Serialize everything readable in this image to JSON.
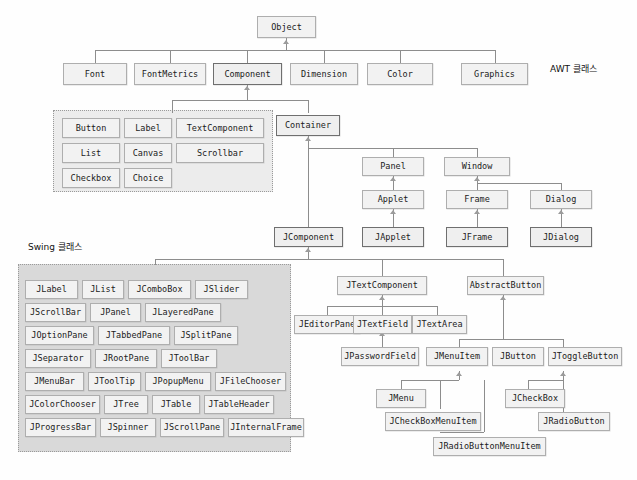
{
  "diagram": {
    "captions": {
      "awt": "AWT 클래스",
      "swing": "Swing 클래스"
    },
    "colors": {
      "node_fill": "#f2f2f2",
      "node_border": "#aeaeae",
      "node_border_emphasis": "#6f6f6f",
      "awt_group_fill": "#ececec",
      "swing_group_fill": "#d9d9d9",
      "group_border": "#9a9a9a",
      "connector": "#8d8d8d",
      "background": "#fefefe"
    },
    "root": {
      "label": "Object"
    },
    "awt_top_row": [
      {
        "label": "Font"
      },
      {
        "label": "FontMetrics"
      },
      {
        "label": "Component",
        "emphasis": true
      },
      {
        "label": "Dimension"
      },
      {
        "label": "Color"
      },
      {
        "label": "Graphics"
      }
    ],
    "awt_component_group": [
      {
        "label": "Button"
      },
      {
        "label": "Label"
      },
      {
        "label": "TextComponent"
      },
      {
        "label": "List"
      },
      {
        "label": "Canvas"
      },
      {
        "label": "Scrollbar"
      },
      {
        "label": "Checkbox"
      },
      {
        "label": "Choice"
      }
    ],
    "container": {
      "label": "Container",
      "emphasis": true
    },
    "window_branch": [
      {
        "label": "Panel"
      },
      {
        "label": "Window"
      },
      {
        "label": "Applet"
      },
      {
        "label": "Frame"
      },
      {
        "label": "Dialog"
      },
      {
        "label": "JApplet",
        "emphasis": true
      },
      {
        "label": "JFrame",
        "emphasis": true
      },
      {
        "label": "JDialog",
        "emphasis": true
      }
    ],
    "jcomponent": {
      "label": "JComponent",
      "emphasis": true
    },
    "swing_group": [
      {
        "label": "JLabel"
      },
      {
        "label": "JList"
      },
      {
        "label": "JComboBox"
      },
      {
        "label": "JSlider"
      },
      {
        "label": "JScrollBar"
      },
      {
        "label": "JPanel"
      },
      {
        "label": "JLayeredPane"
      },
      {
        "label": "JOptionPane"
      },
      {
        "label": "JTabbedPane"
      },
      {
        "label": "JSplitPane"
      },
      {
        "label": "JSeparator"
      },
      {
        "label": "JRootPane"
      },
      {
        "label": "JToolBar"
      },
      {
        "label": "JMenuBar"
      },
      {
        "label": "JToolTip"
      },
      {
        "label": "JPopupMenu"
      },
      {
        "label": "JFileChooser"
      },
      {
        "label": "JColorChooser"
      },
      {
        "label": "JTree"
      },
      {
        "label": "JTable"
      },
      {
        "label": "JTableHeader"
      },
      {
        "label": "JProgressBar"
      },
      {
        "label": "JSpinner"
      },
      {
        "label": "JScrollPane"
      },
      {
        "label": "JInternalFrame"
      }
    ],
    "text_branch": [
      {
        "label": "JTextComponent"
      },
      {
        "label": "JEditorPane"
      },
      {
        "label": "JTextField"
      },
      {
        "label": "JTextArea"
      },
      {
        "label": "JPasswordField"
      }
    ],
    "button_branch": [
      {
        "label": "AbstractButton"
      },
      {
        "label": "JMenuItem"
      },
      {
        "label": "JButton"
      },
      {
        "label": "JToggleButton"
      },
      {
        "label": "JMenu"
      },
      {
        "label": "JCheckBoxMenuItem"
      },
      {
        "label": "JRadioButtonMenuItem"
      },
      {
        "label": "JCheckBox"
      },
      {
        "label": "JRadioButton"
      }
    ]
  }
}
